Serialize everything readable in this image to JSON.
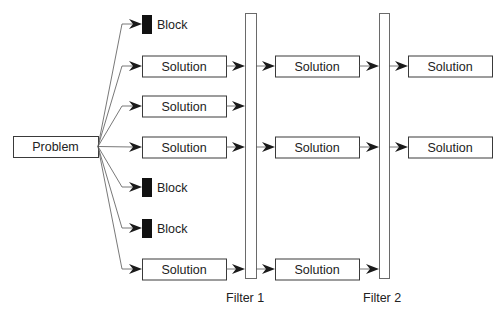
{
  "diagram": {
    "problem": {
      "label": "Problem",
      "x": 13,
      "y": 136,
      "w": 85,
      "h": 21
    },
    "filters": [
      {
        "label": "Filter 1",
        "x": 245,
        "y": 13,
        "w": 11,
        "h": 265,
        "label_x": 226,
        "label_y": 302
      },
      {
        "label": "Filter 2",
        "x": 379,
        "y": 13,
        "w": 10,
        "h": 265,
        "label_x": 363,
        "label_y": 302
      }
    ],
    "branches": [
      {
        "type": "block",
        "label": "Block",
        "y": 24,
        "passes": 0
      },
      {
        "type": "solution",
        "label": "Solution",
        "y": 66,
        "passes": 2
      },
      {
        "type": "solution",
        "label": "Solution",
        "y": 106,
        "passes": 0
      },
      {
        "type": "solution",
        "label": "Solution",
        "y": 147,
        "passes": 2
      },
      {
        "type": "block",
        "label": "Block",
        "y": 187,
        "passes": 0
      },
      {
        "type": "block",
        "label": "Block",
        "y": 228,
        "passes": 0
      },
      {
        "type": "solution",
        "label": "Solution",
        "y": 269,
        "passes": 1
      }
    ],
    "columns": {
      "col1_x": 142,
      "col2_x": 275,
      "col3_x": 408,
      "box_w": 84,
      "box_h": 21
    },
    "colors": {
      "stroke": "#3a3a3a",
      "block": "#111111",
      "arrow": "#1a1a1a"
    }
  }
}
